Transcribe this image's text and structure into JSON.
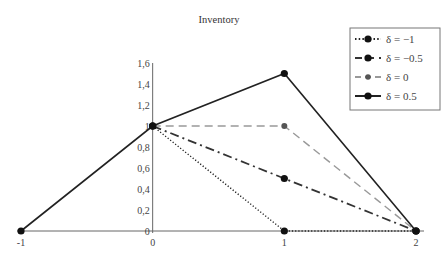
{
  "chart_data": {
    "type": "line",
    "title": "Inventory",
    "xlabel": "",
    "ylabel": "",
    "xlim": [
      -1,
      2
    ],
    "ylim": [
      0,
      1.6
    ],
    "x_ticks": [
      "-1",
      "0",
      "1",
      "2"
    ],
    "x_tick_values": [
      -1,
      0,
      1,
      2
    ],
    "y_ticks": [
      "0",
      "0,2",
      "0,4",
      "0,6",
      "0,8",
      "1",
      "1,2",
      "1,4",
      "1,6"
    ],
    "y_tick_values": [
      0,
      0.2,
      0.4,
      0.6,
      0.8,
      1,
      1.2,
      1.4,
      1.6
    ],
    "grid": false,
    "legend_position": "top-right",
    "series": [
      {
        "name": "δ = −1",
        "style": "dotted",
        "color": "#222222",
        "x": [
          0,
          1,
          2
        ],
        "y": [
          1,
          0,
          0
        ]
      },
      {
        "name": "δ = −0.5",
        "style": "dashdot",
        "color": "#333333",
        "x": [
          0,
          1,
          2
        ],
        "y": [
          1,
          0.5,
          0
        ]
      },
      {
        "name": "δ = 0",
        "style": "dashed",
        "color": "#999999",
        "x": [
          0,
          1,
          2
        ],
        "y": [
          1,
          1,
          0
        ]
      },
      {
        "name": "δ = 0.5",
        "style": "solid",
        "color": "#222222",
        "x": [
          -1,
          0,
          1,
          2
        ],
        "y": [
          0,
          1,
          1.5,
          0
        ]
      }
    ]
  }
}
